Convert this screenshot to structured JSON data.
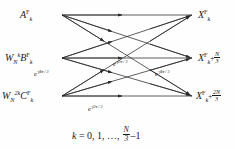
{
  "figure": {
    "background_color": "#fefefe",
    "line_color": "#2a2a2a",
    "text_color": "#1a1a1a"
  },
  "inputs": [
    {
      "id": "input-a",
      "plain": "A_k^F",
      "base": "A",
      "superscript": "F",
      "subscript": "k",
      "prefix": "",
      "prefix_sub": "",
      "prefix_sup": "",
      "y": 15
    },
    {
      "id": "input-b",
      "plain": "W_N^k B_k^F",
      "base": "B",
      "superscript": "F",
      "subscript": "k",
      "prefix": "W",
      "prefix_sub": "N",
      "prefix_sup": "k",
      "y": 58
    },
    {
      "id": "input-c",
      "plain": "W_N^2k C_k^F",
      "base": "C",
      "superscript": "F",
      "subscript": "k",
      "prefix": "W",
      "prefix_sub": "N",
      "prefix_sup": "2k",
      "y": 96
    }
  ],
  "outputs": [
    {
      "id": "output-x0",
      "plain": "X_k^F",
      "base": "X",
      "superscript": "F",
      "subscript": "k",
      "offset_num": "",
      "offset_den": "",
      "y": 15
    },
    {
      "id": "output-x1",
      "plain": "X_{k+N/3}^F",
      "base": "X",
      "superscript": "F",
      "subscript": "k",
      "offset_num": "N",
      "offset_den": "3",
      "y": 58
    },
    {
      "id": "output-x2",
      "plain": "X_{k+2N/3}^F",
      "base": "X",
      "superscript": "F",
      "subscript": "k",
      "offset_num": "2N",
      "offset_den": "3",
      "y": 96
    }
  ],
  "twiddles": [
    {
      "id": "twiddle-left-4pi",
      "plain": "e^{-j4pi/3}",
      "exponent": "-j4π / 3",
      "x": 34,
      "y": 72
    },
    {
      "id": "twiddle-center-2pi",
      "plain": "e^{-j2pi/3}",
      "exponent": "-j2π / 3",
      "x": 113,
      "y": 62
    },
    {
      "id": "twiddle-right-4pi",
      "plain": "e^{-j4pi/3}",
      "exponent": "-j4π / 3",
      "x": 155,
      "y": 72
    },
    {
      "id": "twiddle-bottom-2pi",
      "plain": "e^{-j2pi/3}",
      "exponent": "-j2π / 3",
      "x": 88,
      "y": 107
    }
  ],
  "caption": {
    "plain": "k = 0, 1, ..., N/3 - 1",
    "lead": "k",
    "equals": "= 0, 1, …,",
    "frac_num": "N",
    "frac_den": "3",
    "tail": "–1"
  },
  "geometry": {
    "left_x": 62,
    "right_x": 192,
    "rows": [
      15,
      58,
      96
    ]
  }
}
